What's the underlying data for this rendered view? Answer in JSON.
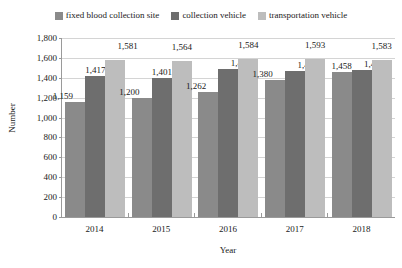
{
  "chart_data": {
    "type": "bar",
    "title": "",
    "xlabel": "Year",
    "ylabel": "Number",
    "categories": [
      "2014",
      "2015",
      "2016",
      "2017",
      "2018"
    ],
    "ylim": [
      0,
      1800
    ],
    "ytick_step": 200,
    "ytick_labels": [
      "1,800",
      "1,600",
      "1,400",
      "1,200",
      "1,000",
      "800",
      "600",
      "400",
      "200",
      "0"
    ],
    "ytick_values": [
      1800,
      1600,
      1400,
      1200,
      1000,
      800,
      600,
      400,
      200,
      0
    ],
    "grid": true,
    "legend_position": "top-center",
    "series": [
      {
        "name": "fixed blood collection site",
        "color": "#8a8a8a",
        "values": [
          1159,
          1200,
          1262,
          1380,
          1458
        ],
        "labels": [
          "1,159",
          "1,200",
          "1,262",
          "1,380",
          "1,458"
        ]
      },
      {
        "name": "collection vehicle",
        "color": "#6e6e6e",
        "values": [
          1417,
          1401,
          1484,
          1471,
          1483
        ],
        "labels": [
          "1,417",
          "1,401",
          "1,484",
          "1,471",
          "1,483"
        ]
      },
      {
        "name": "transportation vehicle",
        "color": "#bdbdbd",
        "values": [
          1581,
          1564,
          1584,
          1593,
          1583
        ],
        "labels": [
          "1,581",
          "1,564",
          "1,584",
          "1,593",
          "1,583"
        ]
      }
    ]
  },
  "legend": {
    "items": [
      {
        "label": "fixed blood collection site",
        "color": "#8a8a8a"
      },
      {
        "label": "collection vehicle",
        "color": "#6e6e6e"
      },
      {
        "label": "transportation vehicle",
        "color": "#bdbdbd"
      }
    ]
  },
  "axes": {
    "y_title": "Number",
    "x_title": "Year"
  },
  "colors": {
    "gridline": "#d4d4d4",
    "axis": "#9a9a9a",
    "text": "#1a1a1a",
    "background": "#ffffff"
  }
}
